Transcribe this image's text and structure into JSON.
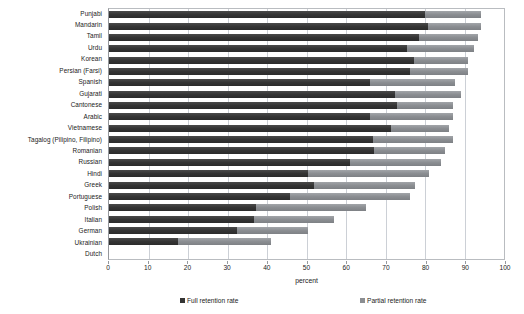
{
  "chart_data": {
    "type": "bar",
    "orientation": "horizontal",
    "stacked": true,
    "title": "",
    "xlabel": "percent",
    "ylabel": "",
    "xlim": [
      0,
      100
    ],
    "xticks": [
      0,
      10,
      20,
      30,
      40,
      50,
      60,
      70,
      80,
      90,
      100
    ],
    "grid": true,
    "legend_position": "bottom",
    "categories": [
      "Punjabi",
      "Mandarin",
      "Tamil",
      "Urdu",
      "Korean",
      "Persian (Farsi)",
      "Spanish",
      "Gujarati",
      "Cantonese",
      "Arabic",
      "Vietnamese",
      "Tagalog (Pilipino, Filipino)",
      "Romanian",
      "Russian",
      "Hindi",
      "Greek",
      "Portuguese",
      "Polish",
      "Italian",
      "German",
      "Ukrainian",
      "Dutch"
    ],
    "series": [
      {
        "name": "Full retention rate",
        "color": "#343434",
        "values": [
          80.0,
          80.8,
          78.5,
          75.5,
          77.3,
          76.3,
          66.0,
          72.5,
          73.0,
          66.0,
          71.5,
          66.8,
          67.0,
          61.0,
          50.5,
          52.0,
          45.8,
          37.3,
          36.8,
          32.5,
          17.5,
          0
        ]
      },
      {
        "name": "Partial retention rate",
        "color": "#8b8e92",
        "values": [
          14.3,
          13.5,
          15.0,
          17.0,
          13.7,
          14.7,
          21.5,
          16.5,
          14.0,
          21.0,
          14.5,
          20.2,
          18.0,
          23.0,
          30.5,
          25.5,
          30.4,
          27.7,
          20.2,
          18.0,
          23.5,
          0
        ]
      }
    ],
    "totals": [
      94.3,
      94.3,
      93.5,
      92.5,
      91.0,
      91.0,
      87.5,
      89.0,
      87.0,
      87.0,
      86.0,
      87.0,
      85.0,
      84.0,
      81.0,
      77.5,
      76.2,
      65.0,
      57.0,
      50.5,
      41.0,
      0
    ]
  },
  "legend": {
    "full_label": "Full retention rate",
    "partial_label": "Partial retention rate"
  },
  "axis": {
    "x_title": "percent"
  }
}
